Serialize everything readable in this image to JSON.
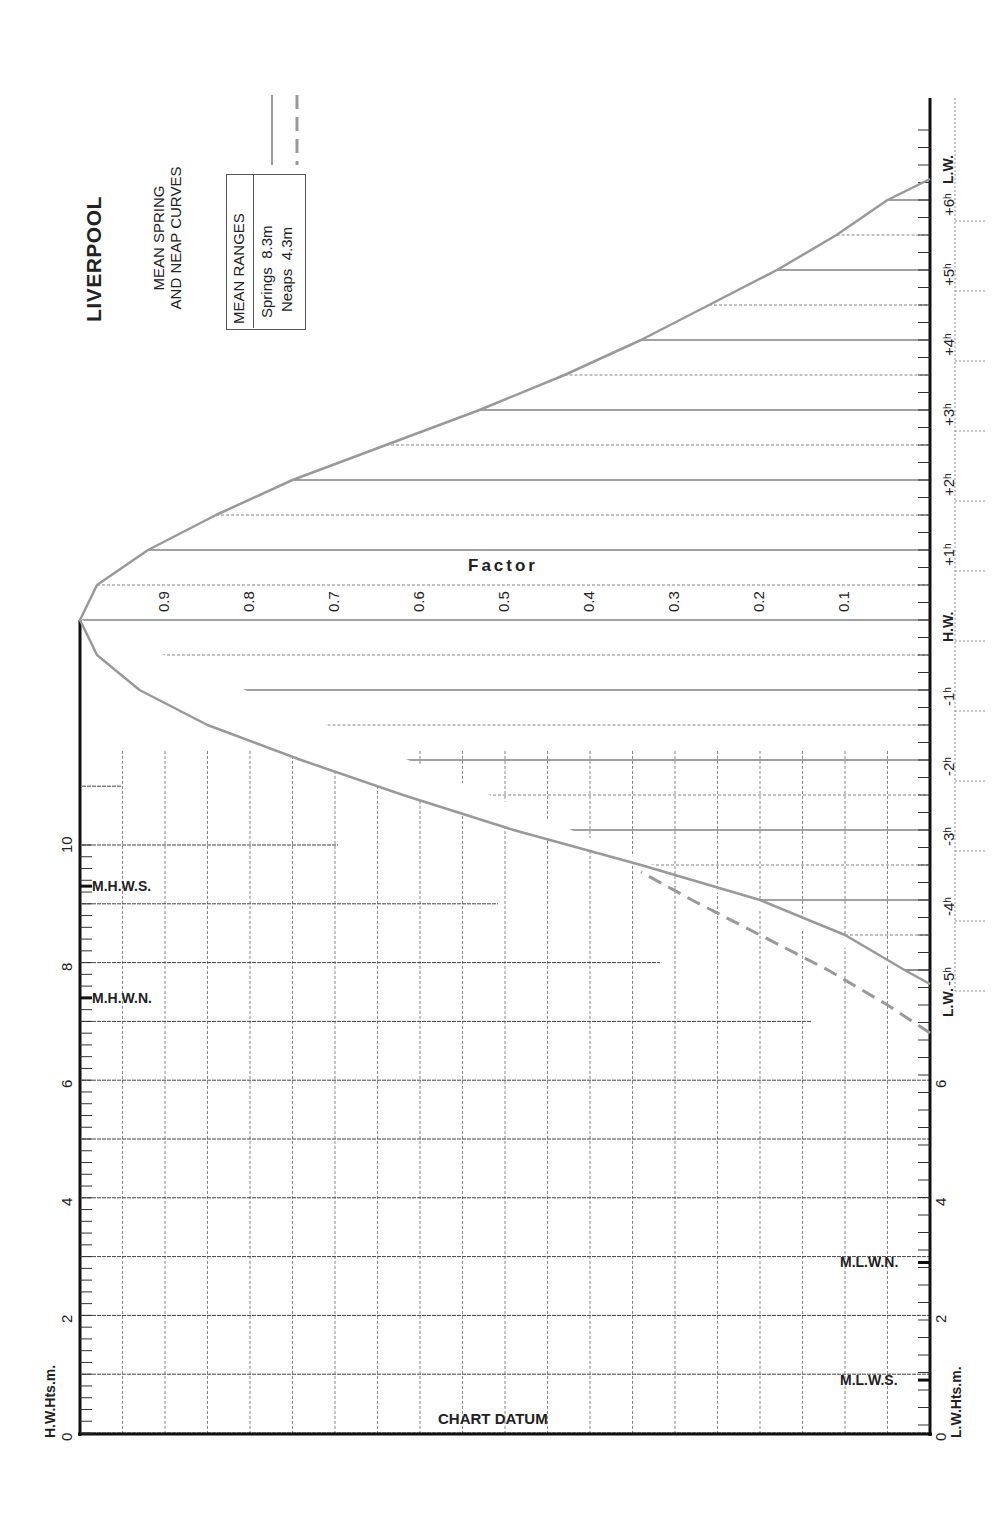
{
  "chart_data": {
    "type": "line",
    "title": "LIVERPOOL",
    "subtitle": "MEAN SPRING AND NEAP CURVES",
    "legend": {
      "heading": "MEAN RANGES",
      "entries": [
        {
          "name": "Springs",
          "value": "8.3m",
          "style": "solid"
        },
        {
          "name": "Neaps",
          "value": "4.3m",
          "style": "dashed"
        }
      ]
    },
    "time_axis": {
      "labels": [
        "L.W.",
        "-5h",
        "-4h",
        "-3h",
        "-2h",
        "-1h",
        "H.W.",
        "+1h",
        "+2h",
        "+3h",
        "+4h",
        "+5h",
        "+6h",
        "L.W."
      ]
    },
    "factor_axis": {
      "label": "Factor",
      "ticks": [
        "0.9",
        "0.8",
        "0.7",
        "0.6",
        "0.5",
        "0.4",
        "0.3",
        "0.2",
        "0.1"
      ]
    },
    "hw_height_axis": {
      "label": "H.W.Hts.m.",
      "ticks": [
        "0",
        "2",
        "4",
        "6",
        "8",
        "10"
      ]
    },
    "lw_height_axis": {
      "label": "L.W.Hts.m.",
      "ticks": [
        "0",
        "2",
        "4",
        "6"
      ]
    },
    "levels": [
      {
        "name": "M.H.W.S.",
        "height_m": 9.3
      },
      {
        "name": "M.H.W.N.",
        "height_m": 7.4
      },
      {
        "name": "M.L.W.N.",
        "height_m": 2.9
      },
      {
        "name": "M.L.W.S.",
        "height_m": 0.9
      }
    ],
    "datum_label": "CHART DATUM",
    "series": [
      {
        "name": "Springs",
        "hours": [
          -5.2,
          -5,
          -4.5,
          -4,
          -3.5,
          -3,
          -2.5,
          -2,
          -1.5,
          -1,
          -0.5,
          0,
          0.5,
          1,
          1.5,
          2,
          2.5,
          3,
          3.5,
          4,
          4.5,
          5,
          5.5,
          6,
          6.3
        ],
        "factor": [
          0.0,
          0.03,
          0.1,
          0.2,
          0.34,
          0.49,
          0.62,
          0.74,
          0.85,
          0.93,
          0.98,
          1.0,
          0.98,
          0.92,
          0.84,
          0.75,
          0.64,
          0.53,
          0.43,
          0.34,
          0.26,
          0.18,
          0.11,
          0.05,
          0.0
        ]
      },
      {
        "name": "Neaps",
        "hours": [
          -5.9,
          -5.5,
          -5,
          -4.5,
          -4,
          -3.6
        ],
        "factor": [
          0.0,
          0.05,
          0.12,
          0.2,
          0.28,
          0.34
        ]
      }
    ],
    "grid": true
  }
}
